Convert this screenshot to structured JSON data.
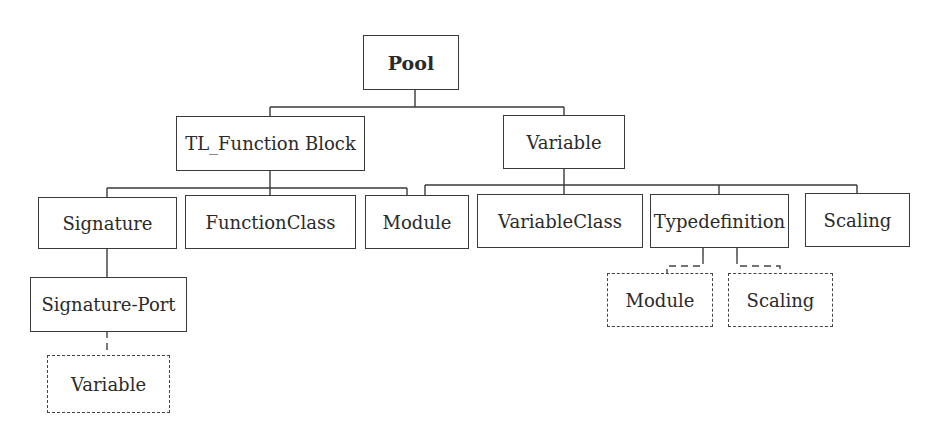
{
  "diagram": {
    "type": "hierarchy-tree",
    "nodes": {
      "pool": {
        "label": "Pool",
        "style": "solid-bold"
      },
      "tl_function_block": {
        "label": "TL_Function Block",
        "style": "solid"
      },
      "variable": {
        "label": "Variable",
        "style": "solid"
      },
      "signature": {
        "label": "Signature",
        "style": "solid"
      },
      "function_class": {
        "label": "FunctionClass",
        "style": "solid"
      },
      "module": {
        "label": "Module",
        "style": "solid"
      },
      "variable_class": {
        "label": "VariableClass",
        "style": "solid"
      },
      "typedefinition": {
        "label": "Typedefinition",
        "style": "solid"
      },
      "scaling": {
        "label": "Scaling",
        "style": "solid"
      },
      "signature_port": {
        "label": "Signature-Port",
        "style": "solid"
      },
      "ref_variable": {
        "label": "Variable",
        "style": "dashed"
      },
      "ref_module": {
        "label": "Module",
        "style": "dashed"
      },
      "ref_scaling": {
        "label": "Scaling",
        "style": "dashed"
      }
    },
    "edges": [
      {
        "from": "pool",
        "to": "tl_function_block",
        "style": "solid"
      },
      {
        "from": "pool",
        "to": "variable",
        "style": "solid"
      },
      {
        "from": "tl_function_block",
        "to": "signature",
        "style": "solid"
      },
      {
        "from": "tl_function_block",
        "to": "function_class",
        "style": "solid"
      },
      {
        "from": "tl_function_block",
        "to": "module",
        "style": "solid"
      },
      {
        "from": "variable",
        "to": "module",
        "style": "solid"
      },
      {
        "from": "variable",
        "to": "variable_class",
        "style": "solid"
      },
      {
        "from": "variable",
        "to": "typedefinition",
        "style": "solid"
      },
      {
        "from": "variable",
        "to": "scaling",
        "style": "solid"
      },
      {
        "from": "signature",
        "to": "signature_port",
        "style": "solid"
      },
      {
        "from": "signature_port",
        "to": "ref_variable",
        "style": "dashed"
      },
      {
        "from": "typedefinition",
        "to": "ref_module",
        "style": "dashed"
      },
      {
        "from": "typedefinition",
        "to": "ref_scaling",
        "style": "dashed"
      }
    ]
  }
}
